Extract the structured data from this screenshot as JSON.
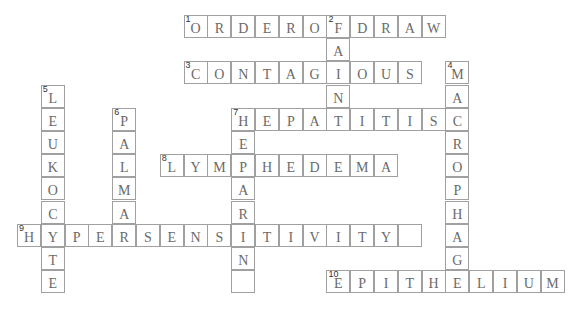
{
  "puzzle": {
    "type": "crossword",
    "entries": [
      {
        "number": "1",
        "direction": "across",
        "answer": "ORDEROFDRAW",
        "row": 0,
        "col": 7
      },
      {
        "number": "2",
        "direction": "down",
        "answer": "FAINT",
        "row": 0,
        "col": 13
      },
      {
        "number": "3",
        "direction": "across",
        "answer": "CONTAGIOUS",
        "row": 2,
        "col": 7
      },
      {
        "number": "4",
        "direction": "down",
        "answer": "MACROPHAGE",
        "row": 2,
        "col": 18
      },
      {
        "number": "5",
        "direction": "down",
        "answer": "LEUKOCYTE",
        "row": 3,
        "col": 1
      },
      {
        "number": "6",
        "direction": "down",
        "answer": "PALMAR",
        "row": 4,
        "col": 4
      },
      {
        "number": "7",
        "direction": "across",
        "answer": "HEPATITISC",
        "row": 4,
        "col": 9
      },
      {
        "number": "7",
        "direction": "down",
        "answer": "HEPARIN ",
        "row": 4,
        "col": 9
      },
      {
        "number": "8",
        "direction": "across",
        "answer": "LYMPHEDEMA",
        "row": 6,
        "col": 6
      },
      {
        "number": "9",
        "direction": "across",
        "answer": "HYPERSENSITIVITY ",
        "row": 9,
        "col": 0
      },
      {
        "number": "10",
        "direction": "across",
        "answer": "EPITHELIUM",
        "row": 11,
        "col": 13
      }
    ]
  }
}
